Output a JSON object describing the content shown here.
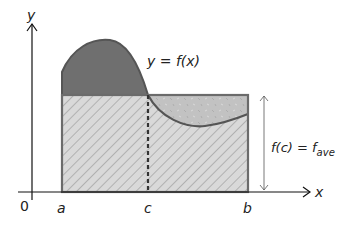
{
  "diagram": {
    "axes": {
      "x_label": "x",
      "y_label": "y",
      "origin_label": "0"
    },
    "tick_labels": {
      "a": "a",
      "c": "c",
      "b": "b"
    },
    "curve_label": "y = f(x)",
    "height_label": {
      "lhs": "f(c) = f",
      "subscript": "ave"
    },
    "regions": [
      {
        "name": "area-above-average",
        "fill": "#6e6e6e",
        "description": "region under curve above rectangle"
      },
      {
        "name": "rectangle-average",
        "fill": "#d4d4d4",
        "pattern": "diagonal-hatch",
        "description": "rectangle of height f_ave"
      },
      {
        "name": "area-below-average",
        "fill": "#bdbdbd",
        "pattern": "speckle",
        "description": "rectangle part above curve"
      }
    ],
    "colors": {
      "axis": "#111111",
      "curve_outline": "#555555",
      "rect_outline": "#6b6b6b",
      "dark_fill": "#6f6f6f",
      "hatch_fill": "#d9d9d9",
      "hatch_line": "#8a8a8a",
      "speckle_fill": "#c2c2c2",
      "dashed_line": "#333333"
    }
  }
}
